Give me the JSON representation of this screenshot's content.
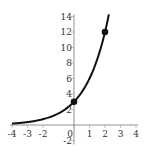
{
  "chart_data": {
    "type": "line",
    "title": "",
    "xlabel": "",
    "ylabel": "",
    "function": "y = 3 * 2^x",
    "xlim": [
      -4,
      4
    ],
    "ylim": [
      -2,
      14
    ],
    "grid": false,
    "x_ticks": [
      -4,
      -3,
      -2,
      0,
      1,
      2,
      3,
      4
    ],
    "x_tick_labels": [
      "-4",
      "-3",
      "-2",
      "0",
      "1",
      "2",
      "3",
      "4"
    ],
    "y_ticks": [
      -2,
      2,
      4,
      6,
      8,
      10,
      12,
      14
    ],
    "y_tick_labels": [
      "-2",
      "2",
      "4",
      "6",
      "8",
      "10",
      "12",
      "14"
    ],
    "series": [
      {
        "name": "exponential",
        "x_range": [
          -4,
          2.25
        ],
        "color": "#111111"
      }
    ],
    "points": [
      {
        "x": 0,
        "y": 3
      },
      {
        "x": 2,
        "y": 12
      }
    ]
  }
}
